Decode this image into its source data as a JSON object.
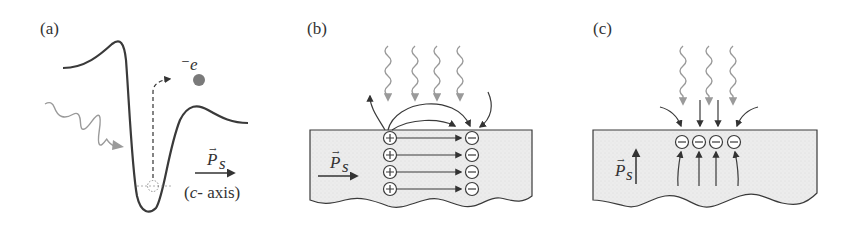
{
  "panels": {
    "a": {
      "label": "(a)",
      "electron_label": "⁻e",
      "polarization_symbol": "P",
      "polarization_subscript": "s",
      "axis_label": "(c- axis)",
      "axis_c": "c",
      "axis_rest": "- axis)",
      "axis_open": "("
    },
    "b": {
      "label": "(b)",
      "polarization_symbol": "P",
      "polarization_subscript": "s",
      "positive_charge": "+",
      "negative_charge": "−",
      "charge_rows": 4,
      "incoming_waves": 4
    },
    "c": {
      "label": "(c)",
      "polarization_symbol": "P",
      "polarization_subscript": "s",
      "negative_charge": "−",
      "charge_count": 4,
      "incoming_waves": 3
    }
  },
  "colors": {
    "line": "#3a3a3a",
    "wave": "#9a9a9a",
    "electron": "#7a7a7a",
    "crystal_fill": "#ececec"
  }
}
